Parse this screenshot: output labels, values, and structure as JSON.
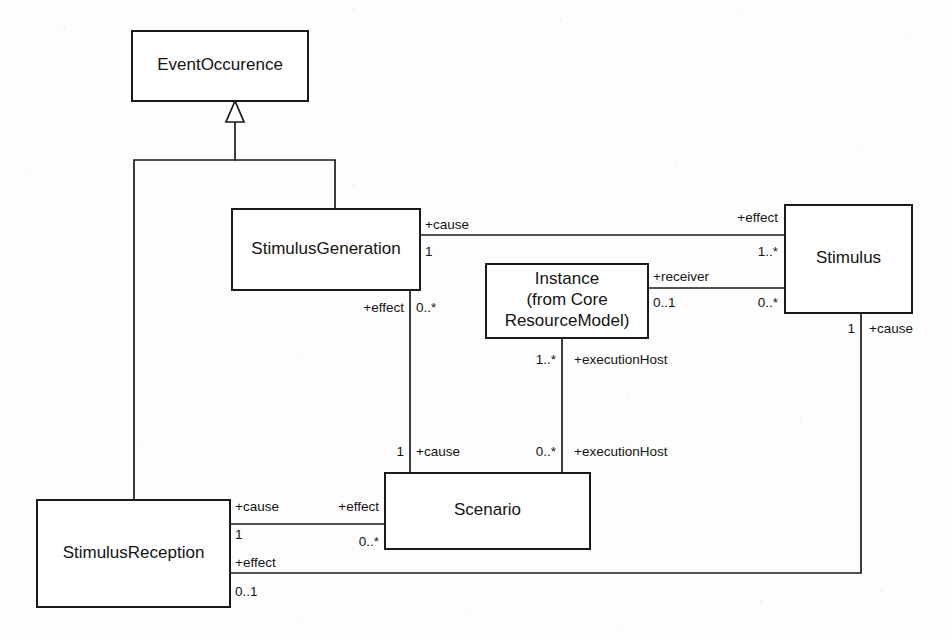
{
  "diagram": {
    "kind": "uml-class-diagram",
    "title": "",
    "background_color": "#fdfdfd",
    "line_color": "#1a1a1a",
    "text_color": "#141414",
    "classes": [
      {
        "id": "eventoccurence",
        "name": "EventOccurence",
        "lines": [
          "EventOccurence"
        ],
        "x": 132,
        "y": 31,
        "w": 176,
        "h": 70
      },
      {
        "id": "stimulusgeneration",
        "name": "StimulusGeneration",
        "lines": [
          "StimulusGeneration"
        ],
        "x": 232,
        "y": 209,
        "w": 188,
        "h": 81
      },
      {
        "id": "instance",
        "name": "Instance (from Core ResourceModel)",
        "lines": [
          "Instance",
          "(from Core",
          "ResourceModel)"
        ],
        "x": 486,
        "y": 264,
        "w": 162,
        "h": 74
      },
      {
        "id": "stimulus",
        "name": "Stimulus",
        "lines": [
          "Stimulus"
        ],
        "x": 785,
        "y": 205,
        "w": 127,
        "h": 108
      },
      {
        "id": "scenario",
        "name": "Scenario",
        "lines": [
          "Scenario"
        ],
        "x": 385,
        "y": 473,
        "w": 205,
        "h": 76
      },
      {
        "id": "stimulusreception",
        "name": "StimulusReception",
        "lines": [
          "StimulusReception"
        ],
        "x": 37,
        "y": 500,
        "w": 193,
        "h": 107
      }
    ],
    "generalizations": [
      {
        "id": "gen-stimulusgeneration-to-eventoccurence",
        "from": "StimulusGeneration",
        "to": "EventOccurence",
        "path": "M 335 209 L 335 160 L 235 160 L 235 122",
        "arrow_points": "235,101 226,122 244,122"
      },
      {
        "id": "gen-stimulusreception-to-eventoccurence",
        "from": "StimulusReception",
        "to": "EventOccurence",
        "path": "M 134 500 L 134 160 L 235 160"
      }
    ],
    "associations": [
      {
        "id": "assoc-stimulusgeneration-stimulus",
        "from": "StimulusGeneration",
        "to": "Stimulus",
        "path": "M 420 235 L 785 235",
        "ends": [
          {
            "role": "+cause",
            "multiplicity": "1"
          },
          {
            "role": "+effect",
            "multiplicity": "1..*"
          }
        ]
      },
      {
        "id": "assoc-instance-stimulus",
        "from": "Instance",
        "to": "Stimulus",
        "path": "M 648 288 L 785 288",
        "ends": [
          {
            "role": "+receiver",
            "multiplicity": "0..1"
          },
          {
            "role": "",
            "multiplicity": "0..*"
          }
        ]
      },
      {
        "id": "assoc-stimulusgeneration-scenario",
        "from": "StimulusGeneration",
        "to": "Scenario",
        "path": "M 410 290 L 410 473",
        "ends": [
          {
            "role": "+effect",
            "multiplicity": "0..*"
          },
          {
            "role": "+cause",
            "multiplicity": "1"
          }
        ]
      },
      {
        "id": "assoc-instance-scenario",
        "from": "Instance",
        "to": "Scenario",
        "path": "M 562 338 L 562 473",
        "ends": [
          {
            "role": "+executionHost",
            "multiplicity": "1..*"
          },
          {
            "role": "+executionHost",
            "multiplicity": "0..*"
          }
        ]
      },
      {
        "id": "assoc-stimulusreception-scenario",
        "from": "StimulusReception",
        "to": "Scenario",
        "path": "M 230 524 L 385 524",
        "ends": [
          {
            "role": "+cause",
            "multiplicity": "1"
          },
          {
            "role": "+effect",
            "multiplicity": "0..*"
          }
        ]
      },
      {
        "id": "assoc-stimulusreception-stimulus",
        "from": "StimulusReception",
        "to": "Stimulus",
        "path": "M 230 573 L 861 573 L 861 313",
        "ends": [
          {
            "role": "+effect",
            "multiplicity": "0..1"
          },
          {
            "role": "+cause",
            "multiplicity": "1"
          }
        ]
      }
    ],
    "edge_labels": [
      {
        "id": "lbl-cause-sg-right",
        "text": "+cause",
        "x": 425,
        "y": 229,
        "anchor": "start"
      },
      {
        "id": "lbl-mult-1-sg-right",
        "text": "1",
        "x": 425,
        "y": 256,
        "anchor": "start"
      },
      {
        "id": "lbl-effect-stimulus-left",
        "text": "+effect",
        "x": 778,
        "y": 222,
        "anchor": "end"
      },
      {
        "id": "lbl-mult-1star-stimulus-left",
        "text": "1..*",
        "x": 778,
        "y": 256,
        "anchor": "end"
      },
      {
        "id": "lbl-receiver-instance-right",
        "text": "+receiver",
        "x": 653,
        "y": 281,
        "anchor": "start"
      },
      {
        "id": "lbl-mult-01-instance-right",
        "text": "0..1",
        "x": 653,
        "y": 307,
        "anchor": "start"
      },
      {
        "id": "lbl-mult-0star-stimulus-left2",
        "text": "0..*",
        "x": 778,
        "y": 307,
        "anchor": "end"
      },
      {
        "id": "lbl-effect-sg-bottom",
        "text": "+effect",
        "x": 404,
        "y": 312,
        "anchor": "end"
      },
      {
        "id": "lbl-mult-0star-sg-bottom",
        "text": "0..*",
        "x": 416,
        "y": 312,
        "anchor": "start"
      },
      {
        "id": "lbl-mult-1-scenario-top-left",
        "text": "1",
        "x": 404,
        "y": 456,
        "anchor": "end"
      },
      {
        "id": "lbl-cause-scenario-top-left",
        "text": "+cause",
        "x": 416,
        "y": 456,
        "anchor": "start"
      },
      {
        "id": "lbl-mult-1star-instance-bottom",
        "text": "1..*",
        "x": 556,
        "y": 364,
        "anchor": "end"
      },
      {
        "id": "lbl-executionhost-instance-bottom",
        "text": "+executionHost",
        "x": 574,
        "y": 364,
        "anchor": "start"
      },
      {
        "id": "lbl-mult-0star-scenario-top",
        "text": "0..*",
        "x": 556,
        "y": 456,
        "anchor": "end"
      },
      {
        "id": "lbl-executionhost-scenario-top",
        "text": "+executionHost",
        "x": 574,
        "y": 456,
        "anchor": "start"
      },
      {
        "id": "lbl-cause-sr-right",
        "text": "+cause",
        "x": 235,
        "y": 511,
        "anchor": "start"
      },
      {
        "id": "lbl-mult-1-sr-right",
        "text": "1",
        "x": 235,
        "y": 539,
        "anchor": "start"
      },
      {
        "id": "lbl-effect-scenario-left",
        "text": "+effect",
        "x": 379,
        "y": 511,
        "anchor": "end"
      },
      {
        "id": "lbl-mult-0star-scenario-left",
        "text": "0..*",
        "x": 379,
        "y": 546,
        "anchor": "end"
      },
      {
        "id": "lbl-effect-sr-bottom",
        "text": "+effect",
        "x": 235,
        "y": 567,
        "anchor": "start"
      },
      {
        "id": "lbl-mult-01-sr-bottom",
        "text": "0..1",
        "x": 235,
        "y": 596,
        "anchor": "start"
      },
      {
        "id": "lbl-mult-1-stimulus-bottom",
        "text": "1",
        "x": 855,
        "y": 333,
        "anchor": "end"
      },
      {
        "id": "lbl-cause-stimulus-bottom",
        "text": "+cause",
        "x": 869,
        "y": 333,
        "anchor": "start"
      }
    ]
  }
}
